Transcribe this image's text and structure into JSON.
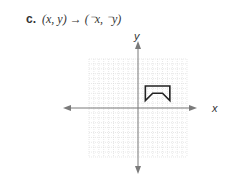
{
  "problem": {
    "label": "c.",
    "expression": "(x, y) → (⁻x, ⁻y)"
  },
  "graph": {
    "x_axis_label": "x",
    "y_axis_label": "y",
    "grid_range": [
      -10,
      10
    ],
    "figure_vertices": [
      [
        1.5,
        4.5
      ],
      [
        6.5,
        4.5
      ],
      [
        6.5,
        1.5
      ],
      [
        5,
        3
      ],
      [
        3,
        3
      ],
      [
        1.5,
        1.5
      ]
    ],
    "colors": {
      "grid": "#d8d8d8",
      "axis": "#7a7a7a",
      "figure": "#222222"
    }
  }
}
